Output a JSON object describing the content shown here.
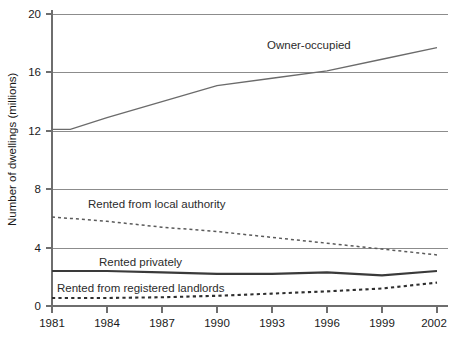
{
  "chart_data": {
    "type": "line",
    "title": "",
    "xlabel": "",
    "ylabel": "Number of dwellings (millions)",
    "xlim": [
      1981,
      2002
    ],
    "ylim": [
      0,
      20
    ],
    "grid": true,
    "legend_position": "inline-annotations",
    "x_ticks": [
      "1981",
      "1984",
      "1987",
      "1990",
      "1993",
      "1996",
      "1999",
      "2002"
    ],
    "y_ticks": [
      "0",
      "4",
      "8",
      "12",
      "16",
      "20"
    ],
    "x": [
      1981,
      1982,
      1984,
      1987,
      1990,
      1993,
      1996,
      1999,
      2002
    ],
    "series": [
      {
        "name": "Owner-occupied",
        "style": "solid-thin",
        "label_x": 1996,
        "values": [
          12.1,
          12.1,
          12.9,
          14.0,
          15.1,
          15.6,
          16.1,
          16.9,
          17.7
        ]
      },
      {
        "name": "Rented from local authority",
        "style": "dotted-fine",
        "label_x": 1989,
        "values": [
          6.1,
          6.0,
          5.8,
          5.4,
          5.1,
          4.7,
          4.3,
          3.9,
          3.5
        ]
      },
      {
        "name": "Rented privately",
        "style": "solid-thick",
        "label_x": 1988,
        "values": [
          2.4,
          2.4,
          2.4,
          2.3,
          2.2,
          2.2,
          2.3,
          2.1,
          2.4
        ]
      },
      {
        "name": "Rented from registered landlords",
        "style": "dotted-bold",
        "label_x": 1987,
        "values": [
          0.55,
          0.55,
          0.55,
          0.6,
          0.7,
          0.85,
          1.0,
          1.2,
          1.6
        ]
      }
    ]
  },
  "annotations": {
    "owner_occupied": "Owner-occupied",
    "local_authority": "Rented from local authority",
    "privately": "Rented privately",
    "registered_landlords": "Rented from registered landlords"
  },
  "axes": {
    "y_title": "Number of dwellings (millions)",
    "y_labels": {
      "t0": "0",
      "t4": "4",
      "t8": "8",
      "t12": "12",
      "t16": "16",
      "t20": "20"
    },
    "x_labels": {
      "t1981": "1981",
      "t1984": "1984",
      "t1987": "1987",
      "t1990": "1990",
      "t1993": "1993",
      "t1996": "1996",
      "t1999": "1999",
      "t2002": "2002"
    }
  },
  "colors": {
    "grid": "#8c8c8c",
    "axis": "#6e6e6e",
    "owner_occupied": "#6b6b6b",
    "local_authority": "#5a5a5a",
    "privately": "#3a3a3a",
    "registered_landlords": "#2e2e2e",
    "text": "#1a1a1a",
    "background": "#ffffff"
  }
}
